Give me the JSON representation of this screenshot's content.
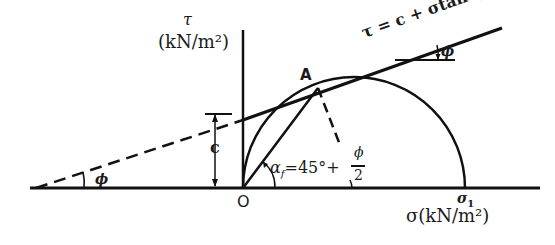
{
  "diagram": {
    "type": "Mohr-Coulomb failure envelope with Mohr circle",
    "axes": {
      "y_symbol": "τ",
      "y_unit": "(kN/m²)",
      "x_label": "σ(kN/m²)",
      "origin_label": "O"
    },
    "points": {
      "tangent_point": "A",
      "sigma1": "σ",
      "sigma1_sub": "1"
    },
    "envelope_equation": "τ = c + σtan ϕ",
    "labels": {
      "cohesion": "c",
      "phi_right": "ϕ",
      "phi_left": "ϕ",
      "failure_angle_prefix": "α",
      "failure_angle_sub": "f",
      "failure_angle_eq": "=45°+",
      "phi_num": "ϕ",
      "frac_den": "2"
    },
    "colors": {
      "line": "#111111",
      "background": "#ffffff"
    }
  }
}
